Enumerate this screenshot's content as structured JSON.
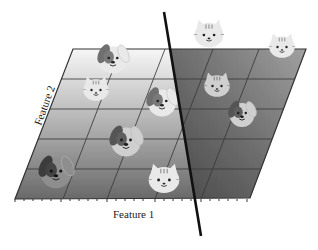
{
  "diagram": {
    "title": "",
    "x_axis_label": "Feature 1",
    "y_axis_label": "Feature 2",
    "plane": {
      "corners": {
        "top_left": [
          73,
          49
        ],
        "top_right": [
          306,
          49
        ],
        "bottom_right": [
          250,
          198
        ],
        "bottom_left": [
          15,
          199
        ]
      },
      "left_region_gradient": [
        "#f4f4f4",
        "#6e6e6e"
      ],
      "right_region_gradient": [
        "#8a8a8a",
        "#5a5a5a"
      ],
      "grid_horizontal_y": [
        79,
        109,
        139,
        169
      ],
      "grid_vertical_top_x": [
        121,
        165,
        213,
        259
      ]
    },
    "decision_boundary": {
      "from": [
        164,
        12
      ],
      "to": [
        201,
        236
      ],
      "color": "#111111"
    },
    "classes": [
      {
        "name": "dog",
        "region": "left"
      },
      {
        "name": "cat",
        "region": "right"
      }
    ],
    "points": [
      {
        "animal": "dog",
        "x": 113,
        "y": 58,
        "size": 34,
        "shade": "light"
      },
      {
        "animal": "cat",
        "x": 96,
        "y": 90,
        "size": 30,
        "shade": "light"
      },
      {
        "animal": "dog",
        "x": 162,
        "y": 101,
        "size": 34,
        "shade": "light"
      },
      {
        "animal": "dog",
        "x": 126,
        "y": 140,
        "size": 36,
        "shade": "mid"
      },
      {
        "animal": "dog",
        "x": 56,
        "y": 171,
        "size": 38,
        "shade": "dark"
      },
      {
        "animal": "cat",
        "x": 164,
        "y": 180,
        "size": 36,
        "shade": "light"
      },
      {
        "animal": "cat",
        "x": 209,
        "y": 35,
        "size": 34,
        "shade": "light"
      },
      {
        "animal": "cat",
        "x": 282,
        "y": 47,
        "size": 30,
        "shade": "light"
      },
      {
        "animal": "cat",
        "x": 217,
        "y": 86,
        "size": 30,
        "shade": "mid"
      },
      {
        "animal": "dog",
        "x": 242,
        "y": 113,
        "size": 30,
        "shade": "mid"
      }
    ]
  }
}
